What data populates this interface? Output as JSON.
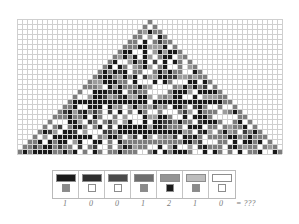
{
  "palette": {
    "black": "#1a1a1a",
    "dark_gray": "#3d3d3d",
    "mid_dark_gray": "#5a5a5a",
    "mid_gray": "#7d7d7d",
    "gray": "#9c9c9c",
    "light_gray": "#c0c0c0",
    "white": "#ffffff",
    "grid_line": "#c8c8c8",
    "border": "#b0b0b0",
    "text": "#7a7a7a"
  },
  "grid": {
    "cols": 53,
    "rows": 28,
    "cell": 5,
    "background": "#ffffff",
    "line_color": "#cfcfcf",
    "pattern_name": "triangle-pixel-mosaic",
    "rows_data": [
      "...........................................0.........................................................",
      "..........................................020........................................................",
      ".........................................02120.......................................................",
      "........................................0211120......................................................",
      ".......................................021011120.....................................................",
      "......................................02110601120....................................................",
      ".....................................0211060601120...................................................",
      "....................................021106060601120..................................................",
      "...................................02110606060601120.................................................",
      "..................................0211060606060601120................................................",
      ".................................021106060606060601120...............................................",
      "................................02110606060606060601120..............................................",
      "...............................0211060606060606060601120.............................................",
      "..............................021106060606060606060601120............................................",
      ".............................02110606060606060606060601120...........................................",
      "............................0211060606060606060606060601120..........................................",
      "...........................021106060606060606060606060601120.........................................",
      "..........................02110606060606060606060606060601120........................................",
      ".........................0211060606060606060606060606060601120.......................................",
      "........................021106060606060606060606060606060601120......................................",
      ".......................02110606060606060606060606060606060601120.....................................",
      "......................0211060606060606060606060606060606060601120....................................",
      ".....................021106060606060606060606060606060606060601120...................................",
      "....................02110606060606060606060606060606060606060601120..................................",
      "...................0211060606060606060606060606060606060606060601120.................................",
      "..................021106060606060606060606060606060606060606060601120................................",
      ".................02110606060606060606060606060606060606060606060601120...............................",
      "................0211111111111111111111111111111111111111111111111120................................"
    ]
  },
  "legend": {
    "title": "",
    "cells": [
      {
        "bar": "#1a1a1a",
        "swatch": "#8a8a8a",
        "digit": "1"
      },
      {
        "bar": "#2e2e2e",
        "swatch": "#ffffff",
        "digit": "0"
      },
      {
        "bar": "#4a4a4a",
        "swatch": "#ffffff",
        "digit": "0"
      },
      {
        "bar": "#6e6e6e",
        "swatch": "#8a8a8a",
        "digit": "1"
      },
      {
        "bar": "#949494",
        "swatch": "#1a1a1a",
        "digit": "2"
      },
      {
        "bar": "#bdbdbd",
        "swatch": "#8a8a8a",
        "digit": "1"
      },
      {
        "bar": "#ffffff",
        "swatch": "#ffffff",
        "digit": "0"
      }
    ]
  },
  "result": {
    "equals_label": "=  ???"
  }
}
